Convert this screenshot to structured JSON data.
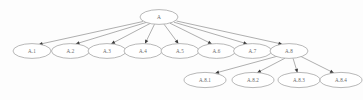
{
  "diagram": {
    "type": "tree",
    "background_color": "#fdfdfd",
    "node_fill_color": "#ffffff",
    "node_stroke_color": "#9a9a9a",
    "edge_color": "#8d8d8d",
    "arrow_color": "#3a3a3a",
    "label_color": "#6b6b6b",
    "nodes": [
      {
        "id": "A",
        "label": "A",
        "cx": 159.0,
        "cy": 17.0,
        "rx": 19.0,
        "ry": 7.4,
        "level": 0
      },
      {
        "id": "A1",
        "label": "A.1",
        "cx": 32.0,
        "cy": 51.0,
        "rx": 19.0,
        "ry": 7.4,
        "level": 1
      },
      {
        "id": "A2",
        "label": "A.2",
        "cx": 70.5,
        "cy": 51.0,
        "rx": 19.0,
        "ry": 7.4,
        "level": 1
      },
      {
        "id": "A3",
        "label": "A.3",
        "cx": 107.0,
        "cy": 51.0,
        "rx": 19.0,
        "ry": 7.4,
        "level": 1
      },
      {
        "id": "A4",
        "label": "A.4",
        "cx": 143.0,
        "cy": 51.0,
        "rx": 19.0,
        "ry": 7.4,
        "level": 1
      },
      {
        "id": "A5",
        "label": "A.5",
        "cx": 180.0,
        "cy": 51.0,
        "rx": 19.0,
        "ry": 7.4,
        "level": 1
      },
      {
        "id": "A6",
        "label": "A.6",
        "cx": 216.5,
        "cy": 51.0,
        "rx": 19.0,
        "ry": 7.4,
        "level": 1
      },
      {
        "id": "A7",
        "label": "A.7",
        "cx": 252.5,
        "cy": 51.0,
        "rx": 19.0,
        "ry": 7.4,
        "level": 1
      },
      {
        "id": "A8",
        "label": "A.8",
        "cx": 289.0,
        "cy": 51.0,
        "rx": 19.0,
        "ry": 7.4,
        "level": 1
      },
      {
        "id": "A81",
        "label": "A.8.1",
        "cx": 205.0,
        "cy": 80.0,
        "rx": 21.0,
        "ry": 7.6,
        "level": 2
      },
      {
        "id": "A82",
        "label": "A.8.2",
        "cx": 253.0,
        "cy": 80.0,
        "rx": 21.0,
        "ry": 7.6,
        "level": 2
      },
      {
        "id": "A83",
        "label": "A.8.3",
        "cx": 299.0,
        "cy": 80.0,
        "rx": 21.0,
        "ry": 7.6,
        "level": 2
      },
      {
        "id": "A84",
        "label": "A.8.4",
        "cx": 341.0,
        "cy": 80.0,
        "rx": 21.0,
        "ry": 7.6,
        "level": 2
      }
    ],
    "edges": [
      {
        "from": "A",
        "to": "A1",
        "x1": 143.0,
        "y1": 21.5,
        "x2": 38.5,
        "y2": 44.5
      },
      {
        "from": "A",
        "to": "A2",
        "x1": 146.0,
        "y1": 22.5,
        "x2": 75.5,
        "y2": 44.0
      },
      {
        "from": "A",
        "to": "A3",
        "x1": 150.0,
        "y1": 23.5,
        "x2": 111.0,
        "y2": 44.0
      },
      {
        "from": "A",
        "to": "A4",
        "x1": 154.5,
        "y1": 24.2,
        "x2": 145.0,
        "y2": 43.8
      },
      {
        "from": "A",
        "to": "A5",
        "x1": 164.0,
        "y1": 24.2,
        "x2": 178.5,
        "y2": 43.8
      },
      {
        "from": "A",
        "to": "A6",
        "x1": 170.0,
        "y1": 23.2,
        "x2": 212.0,
        "y2": 44.0
      },
      {
        "from": "A",
        "to": "A7",
        "x1": 174.0,
        "y1": 22.2,
        "x2": 247.5,
        "y2": 44.0
      },
      {
        "from": "A",
        "to": "A8",
        "x1": 176.5,
        "y1": 21.0,
        "x2": 282.5,
        "y2": 44.2
      },
      {
        "from": "A8",
        "to": "A81",
        "x1": 278.0,
        "y1": 56.0,
        "x2": 215.0,
        "y2": 73.2
      },
      {
        "from": "A8",
        "to": "A82",
        "x1": 285.0,
        "y1": 58.2,
        "x2": 257.0,
        "y2": 72.8
      },
      {
        "from": "A8",
        "to": "A83",
        "x1": 293.0,
        "y1": 58.2,
        "x2": 297.5,
        "y2": 72.8
      },
      {
        "from": "A8",
        "to": "A84",
        "x1": 300.0,
        "y1": 56.0,
        "x2": 334.0,
        "y2": 73.0
      }
    ]
  }
}
